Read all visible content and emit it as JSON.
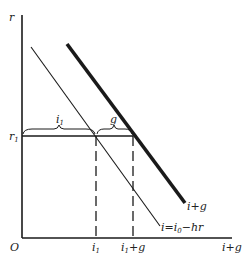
{
  "diagram": {
    "type": "economic-diagram",
    "colors": {
      "ink": "#1a1a1a",
      "background": "#ffffff"
    },
    "axes": {
      "y_label": "r",
      "x_label": "i+g",
      "origin_label": "O"
    },
    "lines": [
      {
        "name": "investment-demand",
        "label": "i=i",
        "label_sub": "0",
        "label_tail": "−hr",
        "weight": "thin"
      },
      {
        "name": "investment-plus-government",
        "label": "i+g",
        "weight": "thick"
      }
    ],
    "levels": {
      "r_level": {
        "label": "r",
        "sub": "1"
      }
    },
    "x_ticks": [
      {
        "label": "i",
        "sub": "1",
        "tail": ""
      },
      {
        "label": "i",
        "sub": "1",
        "tail": "+g"
      }
    ],
    "braces": [
      {
        "label": "i",
        "sub": "1"
      },
      {
        "label": "g",
        "sub": ""
      }
    ]
  }
}
